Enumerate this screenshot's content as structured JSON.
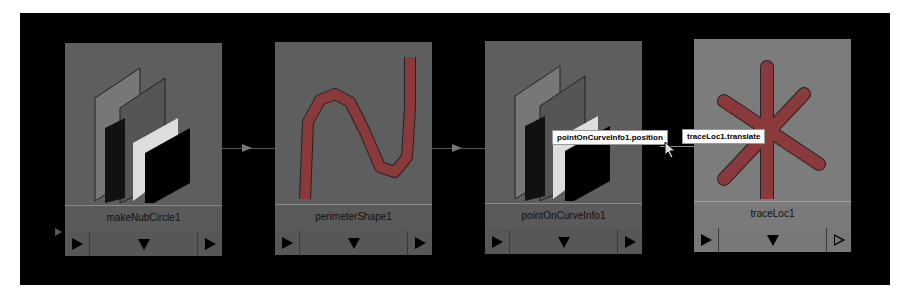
{
  "editor": {
    "nodes": [
      {
        "name": "makeNubCircle1",
        "icon": "nurbs-planes-icon",
        "left_button": "open-triangle",
        "selected": false
      },
      {
        "name": "perimeterShape1",
        "icon": "curve-icon",
        "left_button": "filled-triangle",
        "selected": false
      },
      {
        "name": "pointOnCurveInfo1",
        "icon": "nurbs-planes-icon",
        "left_button": "filled-triangle",
        "selected": false
      },
      {
        "name": "traceLoc1",
        "icon": "locator-icon",
        "left_button": "filled-triangle",
        "selected": true
      }
    ],
    "connection_labels": {
      "source": "pointOnCurveInfo1.position",
      "destination": "traceLoc1.translate"
    }
  },
  "colors": {
    "background": "#000000",
    "node": "#5e5e5e",
    "node_selected": "#7c7c7c",
    "curve": "#8a3a3a"
  }
}
